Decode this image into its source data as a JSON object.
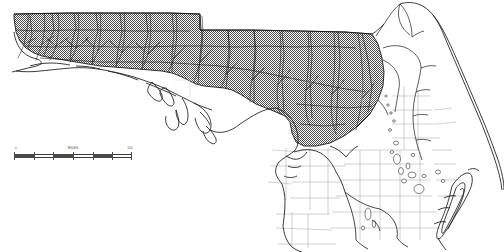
{
  "map": {
    "title": "Florida",
    "region": "Florida panhandle and northern peninsula",
    "style": "black and white line-art reference map",
    "background_color": "#ffffff",
    "line_color": "#1a1a1a",
    "hatch_color": "#4d4d4d",
    "county_line_color": "#8a8a8a",
    "overlay": {
      "name": "crosshatched-extent-area",
      "pattern": "crosshatch",
      "description": "Crosshatched overlay covering the panhandle and north-central Florida"
    },
    "features": [
      {
        "name": "coastline",
        "type": "line"
      },
      {
        "name": "state-boundary",
        "type": "line"
      },
      {
        "name": "county-boundaries",
        "type": "line"
      },
      {
        "name": "rivers",
        "type": "line"
      },
      {
        "name": "lakes",
        "type": "polygon"
      },
      {
        "name": "barrier-islands",
        "type": "polygon"
      }
    ]
  },
  "scale_bar": {
    "name": "distance-scale-bar",
    "left_label": "0",
    "center_label": "MILES",
    "right_label": "100",
    "segments": 6,
    "units": "MILES"
  }
}
